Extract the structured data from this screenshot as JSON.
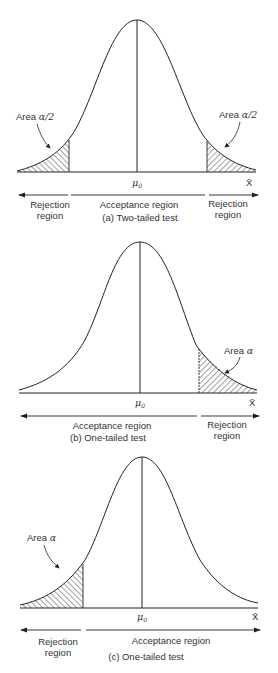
{
  "figure": {
    "panels": [
      {
        "id": "a",
        "caption": "(a) Two-tailed test",
        "mean_label": "μ",
        "mean_sub": "0",
        "axis_label": "X̄",
        "areas": [
          {
            "side": "left",
            "label_prefix": "Area ",
            "label_symbol": "α/2"
          },
          {
            "side": "right",
            "label_prefix": "Area ",
            "label_symbol": "α/2"
          }
        ],
        "regions": [
          {
            "lines": [
              "Rejection",
              "region"
            ]
          },
          {
            "lines": [
              "Acceptance region"
            ]
          },
          {
            "lines": [
              "Rejection",
              "region"
            ]
          }
        ]
      },
      {
        "id": "b",
        "caption": "(b) One-tailed test",
        "mean_label": "μ",
        "mean_sub": "0",
        "axis_label": "X̄",
        "areas": [
          {
            "side": "right",
            "label_prefix": "Area ",
            "label_symbol": "α"
          }
        ],
        "regions": [
          {
            "lines": [
              "Acceptance region"
            ]
          },
          {
            "lines": [
              "Rejection",
              "region"
            ]
          }
        ]
      },
      {
        "id": "c",
        "caption": "(c) One-tailed test",
        "mean_label": "μ",
        "mean_sub": "0",
        "axis_label": "X̄",
        "areas": [
          {
            "side": "left",
            "label_prefix": "Area ",
            "label_symbol": "α"
          }
        ],
        "regions": [
          {
            "lines": [
              "Rejection",
              "region"
            ]
          },
          {
            "lines": [
              "Acceptance region"
            ]
          }
        ]
      }
    ]
  },
  "colors": {
    "line": "#222222",
    "hatch": "#333333",
    "background": "#ffffff"
  }
}
